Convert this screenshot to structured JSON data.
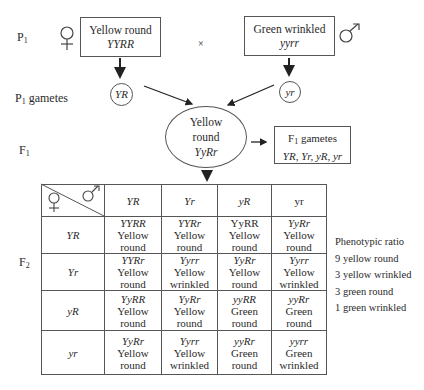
{
  "labels": {
    "p1": "P",
    "p1_sub": "1",
    "p1_gametes": "P",
    "p1_gametes_sub": "1",
    "p1_gametes_suffix": " gametes",
    "f1": "F",
    "f1_sub": "1",
    "f2": "F",
    "f2_sub": "2",
    "cross": "×"
  },
  "parents": {
    "female": {
      "symbol": "female-symbol",
      "phenotype": "Yellow round",
      "genotype": "YYRR",
      "gamete": "YR"
    },
    "male": {
      "symbol": "male-symbol",
      "phenotype": "Green wrinkled",
      "genotype": "yyrr",
      "gamete": "yr"
    }
  },
  "f1": {
    "line1": "Yellow",
    "line2": "round",
    "genotype": "YyRr",
    "gametes_title": "F",
    "gametes_title_sub": "1",
    "gametes_title_suffix": " gametes",
    "gametes_list": "YR, Yr, yR, yr"
  },
  "punnett": {
    "col_headers": [
      "YR",
      "Yr",
      "yR",
      "yr"
    ],
    "row_headers": [
      "YR",
      "Yr",
      "yR",
      "yr"
    ],
    "rows": [
      [
        {
          "geno": "YYRR",
          "l1": "Yellow",
          "l2": "round"
        },
        {
          "geno": "YYRr",
          "l1": "Yellow",
          "l2": "round"
        },
        {
          "geno": "YyRR",
          "l1": "Yellow",
          "l2": "round"
        },
        {
          "geno": "YyRr",
          "l1": "Yellow",
          "l2": "round"
        }
      ],
      [
        {
          "geno": "YYRr",
          "l1": "Yellow",
          "l2": "round"
        },
        {
          "geno": "Yyrr",
          "l1": "Yellow",
          "l2": "wrinkled"
        },
        {
          "geno": "YyRr",
          "l1": "Yellow",
          "l2": "round"
        },
        {
          "geno": "Yyrr",
          "l1": "Yellow",
          "l2": "wrinkled"
        }
      ],
      [
        {
          "geno": "YyRR",
          "l1": "Yellow",
          "l2": "round"
        },
        {
          "geno": "YyRr",
          "l1": "Yellow",
          "l2": "round"
        },
        {
          "geno": "yyRR",
          "l1": "Green",
          "l2": "round"
        },
        {
          "geno": "yyRr",
          "l1": "Green",
          "l2": "round"
        }
      ],
      [
        {
          "geno": "YyRr",
          "l1": "Yellow",
          "l2": "round"
        },
        {
          "geno": "Yyrr",
          "l1": "Yellow",
          "l2": "wrinkled"
        },
        {
          "geno": "yyRr",
          "l1": "Green",
          "l2": "round"
        },
        {
          "geno": "yyrr",
          "l1": "Green",
          "l2": "wrinkled"
        }
      ]
    ]
  },
  "ratio": {
    "title": "Phenotypic ratio",
    "items": [
      "9 yellow round",
      "3 yellow wrinkled",
      "3 green round",
      "1 green wrinkled"
    ]
  },
  "colors": {
    "line": "#555555",
    "text": "#2a2a2a",
    "background": "#ffffff"
  }
}
